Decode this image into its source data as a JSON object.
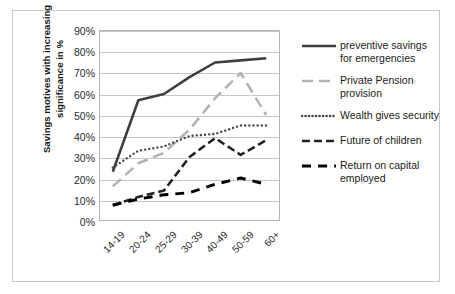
{
  "chart_data": {
    "type": "line",
    "title": "",
    "xlabel": "",
    "ylabel": "Savings motives with increasing significance in  %",
    "categories": [
      "14-19",
      "20-24",
      "25-29",
      "30-39",
      "40-49",
      "50-59",
      "60+"
    ],
    "ylim": [
      0,
      90
    ],
    "ytick_labels": [
      "0%",
      "10%",
      "20%",
      "30%",
      "40%",
      "50%",
      "60%",
      "70%",
      "80%",
      "90%"
    ],
    "ytick_values": [
      0,
      10,
      20,
      30,
      40,
      50,
      60,
      70,
      80,
      90
    ],
    "grid": true,
    "legend_position": "right",
    "series": [
      {
        "name": "preventive savings for emergencies",
        "style": "solid",
        "color": "#3f3f3f",
        "width": 2.6,
        "values": [
          23,
          57,
          60,
          68,
          75,
          76,
          77
        ]
      },
      {
        "name": "Private Pension provision",
        "style": "long-dash",
        "color": "#b3b3b3",
        "width": 2.6,
        "values": [
          16,
          27,
          32,
          43,
          58,
          70,
          50
        ]
      },
      {
        "name": "Wealth gives security",
        "style": "dotted",
        "color": "#4a4a4a",
        "width": 2.4,
        "values": [
          25,
          33,
          35,
          40,
          41,
          45,
          45
        ]
      },
      {
        "name": "Future of children",
        "style": "dashed",
        "color": "#222222",
        "width": 2.6,
        "values": [
          7,
          11,
          14,
          30,
          39,
          31,
          38
        ]
      },
      {
        "name": "Return on capital employed",
        "style": "dash-dot",
        "color": "#000000",
        "width": 3.0,
        "values": [
          7,
          10,
          12,
          13,
          17,
          20,
          17
        ]
      }
    ]
  },
  "axis": {
    "y_title": "Savings motives with increasing significance in  %"
  },
  "legend": {
    "items": [
      {
        "label_line1": "preventive savings",
        "label_line2": "for emergencies",
        "style": "solid",
        "color": "#3f3f3f"
      },
      {
        "label_line1": "Private Pension",
        "label_line2": "provision",
        "style": "long-dash",
        "color": "#b3b3b3"
      },
      {
        "label_line1": "Wealth gives security",
        "label_line2": "",
        "style": "dotted",
        "color": "#4a4a4a"
      },
      {
        "label_line1": "Future of children",
        "label_line2": "",
        "style": "dashed",
        "color": "#222222"
      },
      {
        "label_line1": "Return on capital",
        "label_line2": "employed",
        "style": "dash-dot",
        "color": "#000000"
      }
    ]
  }
}
